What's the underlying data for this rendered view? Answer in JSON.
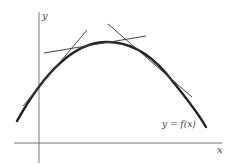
{
  "diagram": {
    "title": "",
    "axes": {
      "x_label": "x",
      "y_label": "y"
    },
    "curve_label": "y = f(x)",
    "colors": {
      "curve": "#222222",
      "tangent": "#444444",
      "axis": "#555555",
      "background": "#ffffff"
    },
    "elements": [
      {
        "type": "curve",
        "description": "concave-down parabola-like curve y = f(x)"
      },
      {
        "type": "tangent",
        "description": "tangent line on rising part of curve, left side"
      },
      {
        "type": "tangent",
        "description": "nearly horizontal tangent near the maximum"
      },
      {
        "type": "tangent",
        "description": "tangent line on falling part of curve, right side"
      }
    ]
  }
}
